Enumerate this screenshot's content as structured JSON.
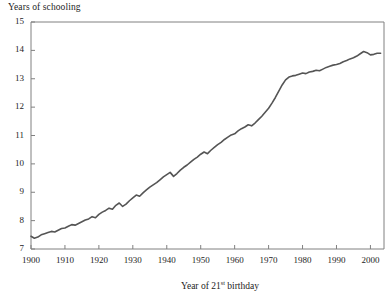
{
  "chart_data": {
    "type": "line",
    "title": "",
    "ylabel": "Years of schooling",
    "xlabel_html": "Year of 21<sup>st</sup> birthday",
    "xlabel": "Year of 21st birthday",
    "xlim": [
      1900,
      2004
    ],
    "ylim": [
      7,
      15
    ],
    "xticks": [
      1900,
      1910,
      1920,
      1930,
      1940,
      1950,
      1960,
      1970,
      1980,
      1990,
      2000
    ],
    "yticks": [
      7,
      8,
      9,
      10,
      11,
      12,
      13,
      14,
      15
    ],
    "grid": false,
    "legend": "none",
    "line_color": "#555555",
    "axis_color": "#808080",
    "series": [
      {
        "name": "Years of schooling",
        "x": [
          1900,
          1901,
          1902,
          1903,
          1904,
          1905,
          1906,
          1907,
          1908,
          1909,
          1910,
          1911,
          1912,
          1913,
          1914,
          1915,
          1916,
          1917,
          1918,
          1919,
          1920,
          1921,
          1922,
          1923,
          1924,
          1925,
          1926,
          1927,
          1928,
          1929,
          1930,
          1931,
          1932,
          1933,
          1934,
          1935,
          1936,
          1937,
          1938,
          1939,
          1940,
          1941,
          1942,
          1943,
          1944,
          1945,
          1946,
          1947,
          1948,
          1949,
          1950,
          1951,
          1952,
          1953,
          1954,
          1955,
          1956,
          1957,
          1958,
          1959,
          1960,
          1961,
          1962,
          1963,
          1964,
          1965,
          1966,
          1967,
          1968,
          1969,
          1970,
          1971,
          1972,
          1973,
          1974,
          1975,
          1976,
          1977,
          1978,
          1979,
          1980,
          1981,
          1982,
          1983,
          1984,
          1985,
          1986,
          1987,
          1988,
          1989,
          1990,
          1991,
          1992,
          1993,
          1994,
          1995,
          1996,
          1997,
          1998,
          1999,
          2000,
          2001,
          2002,
          2003
        ],
        "values": [
          7.45,
          7.38,
          7.42,
          7.5,
          7.54,
          7.58,
          7.62,
          7.6,
          7.66,
          7.72,
          7.74,
          7.8,
          7.86,
          7.84,
          7.9,
          7.96,
          8.02,
          8.06,
          8.14,
          8.1,
          8.22,
          8.3,
          8.36,
          8.44,
          8.4,
          8.54,
          8.62,
          8.5,
          8.58,
          8.7,
          8.8,
          8.9,
          8.86,
          8.98,
          9.08,
          9.18,
          9.26,
          9.34,
          9.44,
          9.54,
          9.62,
          9.7,
          9.56,
          9.66,
          9.78,
          9.88,
          9.96,
          10.06,
          10.16,
          10.24,
          10.34,
          10.42,
          10.36,
          10.48,
          10.58,
          10.68,
          10.76,
          10.86,
          10.94,
          11.02,
          11.06,
          11.16,
          11.24,
          11.3,
          11.38,
          11.34,
          11.44,
          11.56,
          11.68,
          11.82,
          11.96,
          12.14,
          12.34,
          12.56,
          12.78,
          12.96,
          13.06,
          13.1,
          13.12,
          13.16,
          13.2,
          13.18,
          13.24,
          13.26,
          13.3,
          13.28,
          13.34,
          13.4,
          13.44,
          13.48,
          13.5,
          13.54,
          13.6,
          13.64,
          13.7,
          13.74,
          13.8,
          13.88,
          13.96,
          13.92,
          13.84,
          13.86,
          13.9,
          13.9
        ]
      }
    ]
  }
}
